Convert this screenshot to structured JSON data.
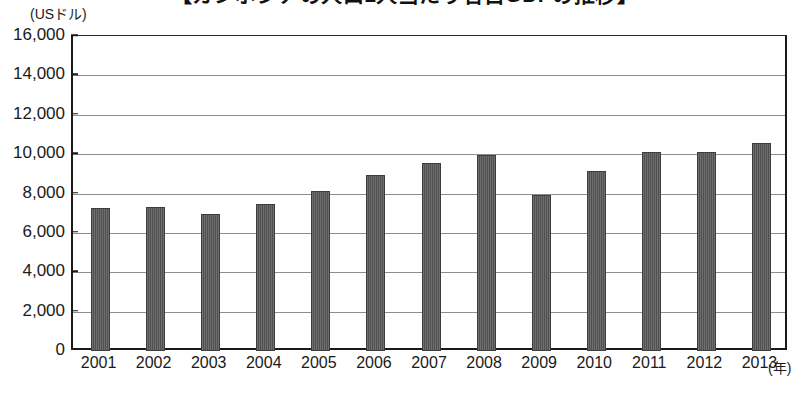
{
  "chart_data": {
    "type": "bar",
    "title": "【カンボジアの人口1人当たり名目GDPの推移】",
    "subtitle": "",
    "unit_label": "(USドル)",
    "xlabel": "(年)",
    "ylabel": "",
    "categories": [
      "2001",
      "2002",
      "2003",
      "2004",
      "2005",
      "2006",
      "2007",
      "2008",
      "2009",
      "2010",
      "2011",
      "2012",
      "2013"
    ],
    "values": [
      7250,
      7300,
      6950,
      7450,
      8150,
      8950,
      9550,
      9950,
      7900,
      9150,
      10100,
      10100,
      10550
    ],
    "ylim": [
      0,
      16000
    ],
    "ytick_values": [
      0,
      2000,
      4000,
      6000,
      8000,
      10000,
      12000,
      14000,
      16000
    ],
    "ytick_labels": [
      "0",
      "2,000",
      "4,000",
      "6,000",
      "8,000",
      "10,000",
      "12,000",
      "14,000",
      "16,000"
    ],
    "grid": true,
    "legend": "none",
    "bar_color": "#595959",
    "gridline_color": "#8e8e8e",
    "axis_color": "#1a1a1a",
    "footnote": ""
  }
}
